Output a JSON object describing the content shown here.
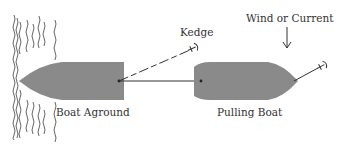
{
  "diagram": {
    "type": "kedging-illustration",
    "labels": {
      "kedge": "Kedge",
      "wind_or_current": "Wind or Current",
      "boat_aground": "Boat Aground",
      "pulling_boat": "Pulling Boat"
    },
    "colors": {
      "hull": "#8a8a8a",
      "line": "#333333",
      "text": "#333333",
      "shore": "#555555"
    },
    "elements": [
      {
        "id": "shore",
        "kind": "shoreline-hatching"
      },
      {
        "id": "boat-aground",
        "kind": "hull",
        "bow": "left"
      },
      {
        "id": "pulling-boat",
        "kind": "hull",
        "bow": "right"
      },
      {
        "id": "kedge-anchor",
        "kind": "anchor",
        "connected_to": "boat-aground"
      },
      {
        "id": "tow-line",
        "kind": "line",
        "from": "boat-aground",
        "to": "pulling-boat"
      },
      {
        "id": "pulling-boat-anchor",
        "kind": "anchor",
        "connected_to": "pulling-boat"
      },
      {
        "id": "wind-arrow",
        "kind": "arrow",
        "direction": "down"
      }
    ]
  }
}
